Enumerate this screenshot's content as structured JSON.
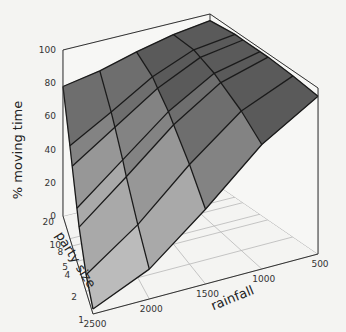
{
  "chart_data": {
    "type": "surface3d",
    "title": "",
    "zlabel": "% moving time",
    "xlabel": "rainfall",
    "ylabel": "party size",
    "zlim": [
      0,
      100
    ],
    "z_ticks": [
      0,
      20,
      40,
      60,
      80,
      100
    ],
    "rainfall_ticks": [
      500,
      1000,
      1500,
      2000,
      2500
    ],
    "party_size_ticks": [
      1,
      2,
      4,
      5,
      8,
      10,
      20
    ],
    "party_size_tick_labels": [
      "1",
      "2",
      "4",
      "5",
      "8",
      "10",
      "20"
    ],
    "rainfall_grid": [
      500,
      1000,
      1500,
      2000,
      2500
    ],
    "party_size_grid": [
      1,
      2,
      4,
      5,
      8,
      10,
      20
    ],
    "surface_z": [
      [
        95,
        97,
        98,
        98,
        98,
        98,
        96
      ],
      [
        75,
        84,
        90,
        92,
        94,
        95,
        93
      ],
      [
        45,
        60,
        72,
        76,
        82,
        85,
        88
      ],
      [
        18,
        32,
        48,
        54,
        65,
        70,
        82
      ],
      [
        3,
        10,
        25,
        32,
        48,
        56,
        78
      ]
    ],
    "surface_z_note": "rows = rainfall (500..2500), cols = party size (1..20); values estimated from the rendered surface",
    "color_bands": [
      "#5a5a5a",
      "#6e6e6e",
      "#838383",
      "#979797",
      "#a9a9a9",
      "#bbbbbb",
      "#cbcbcb"
    ],
    "grid": true
  },
  "axes": {
    "z_label": "% moving time",
    "party_label": "party size",
    "rain_label": "rainfall"
  }
}
